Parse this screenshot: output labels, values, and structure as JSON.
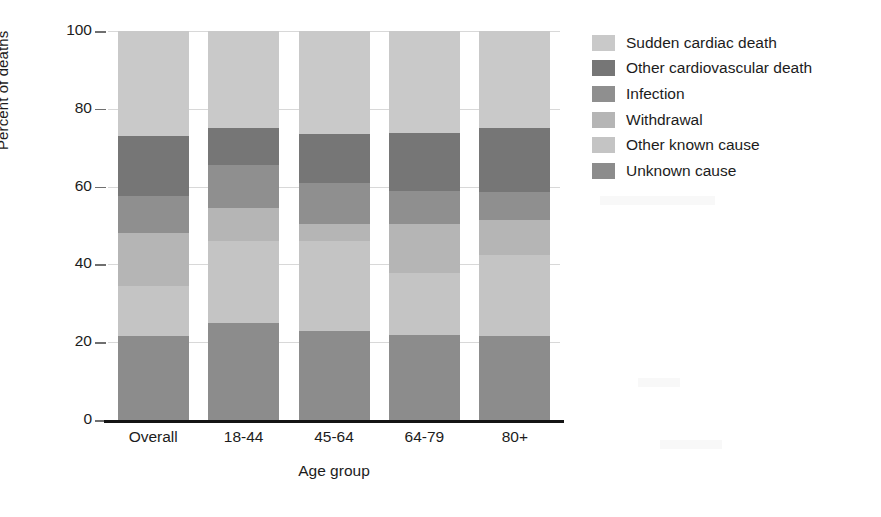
{
  "chart_data": {
    "type": "bar",
    "subtype": "stacked-bar-100-percent",
    "title": "",
    "xlabel": "Age group",
    "ylabel": "Percent of deaths",
    "categories": [
      "Overall",
      "18-44",
      "45-64",
      "64-79",
      "80+"
    ],
    "ylim": [
      0,
      100
    ],
    "yticks": [
      0,
      20,
      40,
      60,
      80,
      100
    ],
    "ytick_labels": [
      "0",
      "20",
      "40",
      "60",
      "80",
      "100"
    ],
    "grid": false,
    "legend_position": "right",
    "stack_order_bottom_to_top": [
      "Unknown cause",
      "Other known cause",
      "Withdrawal",
      "Infection",
      "Other cardiovascular death",
      "Sudden cardiac death"
    ],
    "series": [
      {
        "name": "Sudden cardiac death",
        "color": "#c9c9c9",
        "values": [
          27.0,
          25.0,
          26.5,
          26.2,
          25.0
        ]
      },
      {
        "name": "Other cardiovascular death",
        "color": "#767676",
        "values": [
          15.5,
          9.5,
          12.5,
          15.0,
          16.5
        ]
      },
      {
        "name": "Infection",
        "color": "#8f8f8f",
        "values": [
          9.5,
          11.0,
          10.5,
          8.5,
          7.0
        ]
      },
      {
        "name": "Withdrawal",
        "color": "#b5b5b5",
        "values": [
          13.5,
          8.5,
          4.5,
          12.5,
          9.0
        ]
      },
      {
        "name": "Other known cause",
        "color": "#c4c4c4",
        "values": [
          13.0,
          21.0,
          23.0,
          16.0,
          21.0
        ]
      },
      {
        "name": "Unknown cause",
        "color": "#8c8c8c",
        "values": [
          21.5,
          25.0,
          23.0,
          21.8,
          21.5
        ]
      }
    ]
  },
  "axes": {
    "y_title": "Percent of deaths",
    "x_title": "Age group"
  },
  "legend": {
    "items": [
      {
        "label": "Sudden cardiac death",
        "color": "#c9c9c9"
      },
      {
        "label": "Other cardiovascular death",
        "color": "#767676"
      },
      {
        "label": "Infection",
        "color": "#8f8f8f"
      },
      {
        "label": "Withdrawal",
        "color": "#b5b5b5"
      },
      {
        "label": "Other known cause",
        "color": "#c4c4c4"
      },
      {
        "label": "Unknown cause",
        "color": "#8c8c8c"
      }
    ]
  }
}
